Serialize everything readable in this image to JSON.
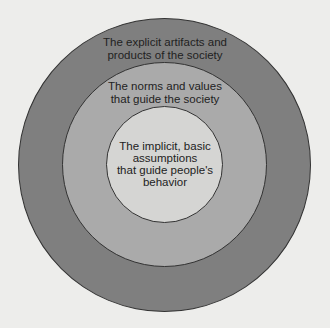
{
  "diagram": {
    "type": "concentric-circles",
    "layers": [
      {
        "name": "outer",
        "label": "The explicit artifacts and\nproducts of the society",
        "color": "#7f7f7f"
      },
      {
        "name": "middle",
        "label": "The norms and values\nthat guide the society",
        "color": "#aaaaaa"
      },
      {
        "name": "inner",
        "label": "The implicit, basic\nassumptions\nthat guide people's\nbehavior",
        "color": "#d5d5d3"
      }
    ],
    "background": "#ededeb"
  }
}
